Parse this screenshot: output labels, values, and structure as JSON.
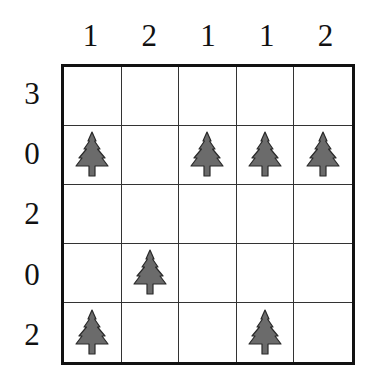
{
  "puzzle": {
    "type": "tents-and-trees",
    "rows": 5,
    "cols": 5,
    "column_clues": [
      "1",
      "2",
      "1",
      "1",
      "2"
    ],
    "row_clues": [
      "3",
      "0",
      "2",
      "0",
      "2"
    ],
    "cells": [
      [
        "",
        "",
        "",
        "",
        ""
      ],
      [
        "tree",
        "",
        "tree",
        "tree",
        "tree"
      ],
      [
        "",
        "",
        "",
        "",
        ""
      ],
      [
        "",
        "tree",
        "",
        "",
        ""
      ],
      [
        "tree",
        "",
        "",
        "tree",
        ""
      ]
    ],
    "colors": {
      "tree_fill": "#6b6b6b",
      "tree_outline": "#2a2a2a",
      "grid_line": "#333333",
      "border": "#111111",
      "background": "#ffffff"
    }
  }
}
